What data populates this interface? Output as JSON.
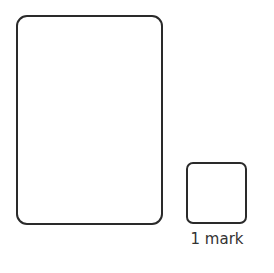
{
  "answer_area": {
    "work_box": "",
    "answer_box": ""
  },
  "marks": {
    "label": "1 mark"
  }
}
